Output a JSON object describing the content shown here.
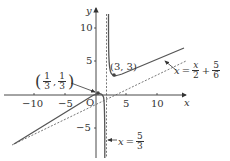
{
  "figure": {
    "axis_x_label": "x",
    "axis_y_label": "y",
    "origin_label": "O",
    "x_ticks": [
      {
        "value": -10,
        "label": "−10"
      },
      {
        "value": -5,
        "label": "−5"
      },
      {
        "value": 5,
        "label": "5"
      },
      {
        "value": 10,
        "label": "10"
      }
    ],
    "y_ticks": [
      {
        "value": 10,
        "label": "10"
      },
      {
        "value": 5,
        "label": "5"
      },
      {
        "value": -5,
        "label": "−5"
      }
    ],
    "points": [
      {
        "name": "turning-point",
        "label": "(3, 3)",
        "x": 3,
        "y": 3
      },
      {
        "name": "intersection-point",
        "label_num_1": "1",
        "label_den_1": "3",
        "label_num_2": "1",
        "label_den_2": "3",
        "x": 0.3333,
        "y": 0.3333
      }
    ],
    "asymptotes": {
      "vertical": {
        "lhs": "x",
        "equals": "=",
        "num": "5",
        "den": "3",
        "value": 1.6667
      },
      "oblique": {
        "lhs": "x",
        "equals": "=",
        "term1_num": "x",
        "term1_den": "2",
        "plus": "+",
        "term2_num": "5",
        "term2_den": "6",
        "slope": 0.5,
        "intercept": 0.8333
      }
    },
    "colors": {
      "curve": "#555555",
      "asymptote": "#555555",
      "axes": "#333333",
      "text": "#333333"
    }
  }
}
